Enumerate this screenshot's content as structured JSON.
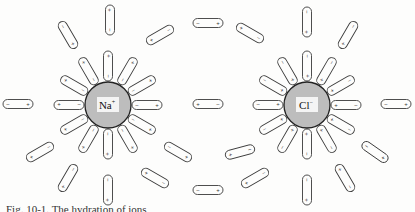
{
  "figure": {
    "caption_partial": "Fig. 10-1.   The hydration of ions",
    "colors": {
      "ink": "#3a3a3a",
      "ion_fill": "#bdbdbd",
      "background": "#fdfdfc"
    },
    "ions": [
      {
        "id": "na",
        "label": "Na",
        "charge": "+",
        "cx": 108,
        "cy": 105,
        "r": 23
      },
      {
        "id": "cl",
        "label": "Cl",
        "charge": "−",
        "cx": 307,
        "cy": 105,
        "r": 23
      }
    ],
    "dipole_shells": [
      {
        "ion": "na",
        "orientation": "negative end toward cation",
        "count": 12,
        "inner_r": 39
      },
      {
        "ion": "cl",
        "orientation": "positive end toward anion",
        "count": 12,
        "inner_r": 39
      }
    ],
    "outer_dipoles": [
      {
        "x": 110,
        "y": 20,
        "angle": 90,
        "neg_end": "bottom"
      },
      {
        "x": 68,
        "y": 35,
        "angle": 60
      },
      {
        "x": 160,
        "y": 35,
        "angle": -30
      },
      {
        "x": 208,
        "y": 23,
        "angle": 0
      },
      {
        "x": 250,
        "y": 33,
        "angle": 30
      },
      {
        "x": 307,
        "y": 22,
        "angle": 90
      },
      {
        "x": 348,
        "y": 35,
        "angle": -60
      },
      {
        "x": 18,
        "y": 104,
        "angle": 0
      },
      {
        "x": 208,
        "y": 104,
        "angle": 0
      },
      {
        "x": 396,
        "y": 104,
        "angle": 0
      },
      {
        "x": 40,
        "y": 152,
        "angle": -30
      },
      {
        "x": 178,
        "y": 152,
        "angle": 30
      },
      {
        "x": 240,
        "y": 152,
        "angle": -15
      },
      {
        "x": 375,
        "y": 152,
        "angle": 35
      },
      {
        "x": 68,
        "y": 178,
        "angle": -60
      },
      {
        "x": 108,
        "y": 190,
        "angle": 90
      },
      {
        "x": 155,
        "y": 178,
        "angle": 30
      },
      {
        "x": 208,
        "y": 190,
        "angle": 0
      },
      {
        "x": 255,
        "y": 178,
        "angle": -30
      },
      {
        "x": 307,
        "y": 190,
        "angle": 90
      },
      {
        "x": 345,
        "y": 178,
        "angle": 60
      }
    ]
  }
}
